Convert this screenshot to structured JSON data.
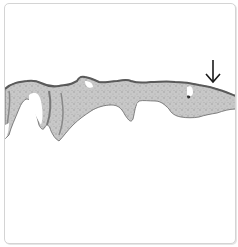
{
  "figure": {
    "type": "histology micrograph",
    "description": "Low-magnification tissue section (grayscale) spanning the width of the frame",
    "annotation": {
      "icon": "down-arrow-icon",
      "glyph": "↓",
      "color": "#1a1a1a"
    },
    "colors": {
      "background": "#ffffff",
      "frame_border": "#d4d4d4",
      "tissue_fill": "#c9c9c9",
      "tissue_dark": "#7a7a7a",
      "tissue_edge": "#555555"
    }
  }
}
